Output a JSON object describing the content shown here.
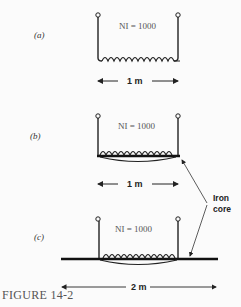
{
  "figure": {
    "caption": "FIGURE 14-2",
    "panels": [
      {
        "label": "(a)",
        "ni_text": "NI = 1000",
        "dimension": "1 m",
        "core": "none"
      },
      {
        "label": "(b)",
        "ni_text": "NI = 1000",
        "dimension": "1 m",
        "core": "iron core, 1 m long"
      },
      {
        "label": "(c)",
        "ni_text": "NI = 1000",
        "dimension": "2 m",
        "core": "iron core, 2 m long"
      }
    ],
    "annotation": {
      "line1": "Iron",
      "line2": "core"
    }
  }
}
